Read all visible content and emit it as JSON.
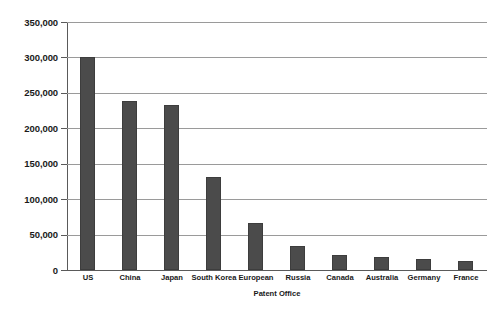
{
  "chart_data": {
    "type": "bar",
    "title": "",
    "subtitle": "",
    "xlabel": "Patent Office",
    "ylabel": "",
    "categories": [
      "US",
      "China",
      "Japan",
      "South Korea",
      "European",
      "Russia",
      "Canada",
      "Australia",
      "Germany",
      "France"
    ],
    "values": [
      300000,
      238000,
      233000,
      131000,
      66000,
      34000,
      21000,
      18000,
      16000,
      13000
    ],
    "ylim": [
      0,
      350000
    ],
    "ytick_labels": [
      "350,000",
      "300,000",
      "250,000",
      "200,000",
      "150,000",
      "100,000",
      "50,000",
      "0"
    ],
    "ytick_values": [
      350000,
      300000,
      250000,
      200000,
      150000,
      100000,
      50000,
      0
    ],
    "grid": true,
    "legend": false,
    "legend_position": "none",
    "bar_color": "#4b4b4b",
    "gridline_color": "#9a9a9a",
    "axis_color": "#5a5a5a",
    "background_color": "#ffffff"
  }
}
